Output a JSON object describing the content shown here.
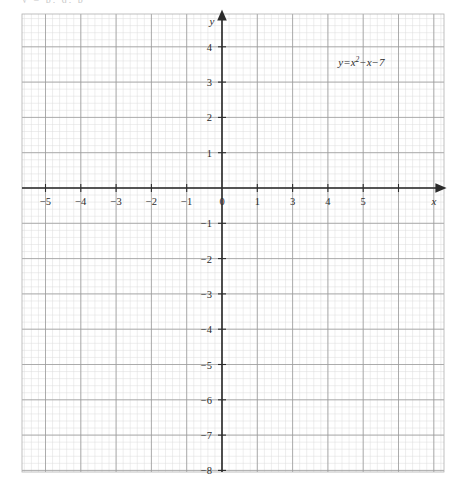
{
  "figure": {
    "background_color": "#ffffff",
    "top_partial_text": "y = p, q, p",
    "plot_area": {
      "left_px": 22,
      "top_px": 14,
      "right_px": 444,
      "bottom_px": 472,
      "origin_x_px": 222,
      "origin_y_px": 188,
      "px_per_unit": 35.3
    },
    "grid": {
      "major_color": "#9a9a9a",
      "minor_color": "#d8d8d8",
      "minor_per_major": 5,
      "show": true
    },
    "axis_color": "#2b2b2b",
    "curve_color": "#1a1a1a",
    "curve_width_px": 2.2
  },
  "chart_data": {
    "type": "line",
    "title": "",
    "subtitle": "",
    "xlabel": "x",
    "ylabel": "y",
    "grid": true,
    "legend_position": "inside-top-right",
    "xlim": [
      -5.66,
      6.28
    ],
    "ylim": [
      -8.04,
      4.93
    ],
    "x_ticks": [
      -5,
      -4,
      -3,
      -2,
      -1,
      0,
      1,
      2,
      3,
      4,
      5
    ],
    "x_tick_labels": [
      "−5",
      "−4",
      "−3",
      "−2",
      "−1",
      "0",
      "",
      "3",
      "4",
      "5",
      ""
    ],
    "x_tick_label_notes": "tick label for x = 2 is faded/erased in the original scan; tick for 1 is drawn at x=1",
    "x_tick_label_one": "1",
    "y_ticks": [
      4,
      3,
      2,
      1,
      -1,
      -2,
      -3,
      -4,
      -5,
      -6,
      -7,
      -8
    ],
    "y_tick_labels": [
      "4",
      "3",
      "2",
      "1",
      "−1",
      "−2",
      "−3",
      "−4",
      "−5",
      "−6",
      "−7",
      "−8"
    ],
    "series": [
      {
        "name": "y=x²−x−7",
        "equation": "y = x^2 - x - 7",
        "a": 1,
        "b": -1,
        "c": -7,
        "vertex": [
          0.5,
          -7.25
        ],
        "roots": [
          -2.1926,
          3.1926
        ],
        "y_intercept": -7,
        "x": [
          -2.4,
          -2.2,
          -2.0,
          -1.8,
          -1.6,
          -1.4,
          -1.2,
          -1.0,
          -0.8,
          -0.6,
          -0.4,
          -0.2,
          0.0,
          0.2,
          0.4,
          0.6,
          0.8,
          1.0,
          1.2,
          1.4,
          1.6,
          1.8,
          2.0,
          2.2,
          2.4,
          2.6,
          2.8,
          3.0,
          3.2,
          3.4
        ],
        "values": [
          1.16,
          0.04,
          -1.0,
          -1.96,
          -2.84,
          -3.64,
          -4.36,
          -5.0,
          -5.56,
          -6.04,
          -6.44,
          -6.76,
          -7.0,
          -7.16,
          -7.24,
          -7.24,
          -7.16,
          -7.0,
          -6.76,
          -6.44,
          -6.04,
          -5.56,
          -5.0,
          -4.36,
          -3.64,
          -2.84,
          -1.96,
          -1.0,
          0.04,
          1.16
        ]
      }
    ],
    "annotations": [
      {
        "text": "y=x²−x−7",
        "data_x": 3.95,
        "data_y": 3.45
      }
    ]
  },
  "axis_labels": {
    "x_axis_name": "x",
    "y_axis_name": "y"
  },
  "equation_label": {
    "lhs": "y",
    "equals": "=",
    "base": "x",
    "exponent": "2",
    "tail": "−x−7",
    "full": "y=x²−x−7"
  }
}
